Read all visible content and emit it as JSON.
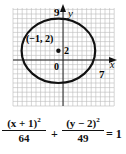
{
  "chart_data": {
    "type": "line",
    "title": "",
    "shape": "ellipse",
    "center": {
      "x": -1,
      "y": 2,
      "label": "(−1, 2)"
    },
    "semi_axes": {
      "a": 8,
      "b": 7
    },
    "equation": "(x + 1)^2/64 + (y − 2)^2/49 = 1",
    "xlabel": "x",
    "ylabel": "y",
    "tick_labels": {
      "origin": "0",
      "y_top": "9",
      "x_right": "7",
      "center_y": "2"
    },
    "xlim": [
      -11,
      11
    ],
    "ylim": [
      -10,
      11
    ],
    "grid": true
  },
  "labels": {
    "y_axis": "y",
    "x_axis": "x",
    "y_tick": "9",
    "x_tick": "7",
    "origin": "0",
    "center_point": "(−1, 2)",
    "center_y_tick": "2"
  },
  "equation": {
    "num1": "(x + 1)",
    "exp1": "2",
    "den1": "64",
    "plus": "+",
    "num2": "(y − 2)",
    "exp2": "2",
    "den2": "49",
    "equals": "= 1"
  }
}
